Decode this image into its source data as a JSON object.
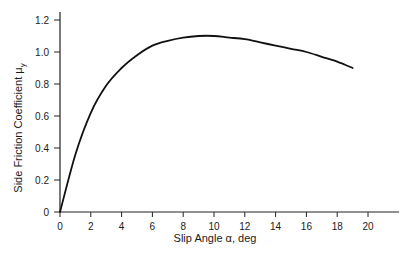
{
  "chart_data": {
    "type": "line",
    "title": "",
    "xlabel": "Slip Angle α, deg",
    "ylabel": "Side Friction Coefficient μ",
    "ylabel_subscript": "y",
    "xlim": [
      0,
      22
    ],
    "ylim": [
      0,
      1.2
    ],
    "xticks": [
      0,
      2,
      4,
      6,
      8,
      10,
      12,
      14,
      16,
      18,
      20
    ],
    "yticks": [
      0,
      0.2,
      0.4,
      0.6,
      0.8,
      1.0,
      1.2
    ],
    "xtick_labels": [
      "0",
      "2",
      "4",
      "6",
      "8",
      "10",
      "12",
      "14",
      "16",
      "18",
      "20"
    ],
    "ytick_labels": [
      "0",
      "0.2",
      "0.4",
      "0.6",
      "0.8",
      "1.0",
      "1.2"
    ],
    "grid": false,
    "legend": null,
    "series": [
      {
        "name": "Side friction coefficient",
        "x": [
          0,
          1,
          2,
          3,
          4,
          5,
          6,
          7,
          8,
          9,
          10,
          11,
          12,
          13,
          14,
          15,
          16,
          17,
          18,
          19
        ],
        "values": [
          0,
          0.36,
          0.62,
          0.79,
          0.9,
          0.98,
          1.04,
          1.07,
          1.09,
          1.1,
          1.1,
          1.09,
          1.08,
          1.06,
          1.04,
          1.02,
          1.0,
          0.97,
          0.94,
          0.9
        ]
      }
    ]
  },
  "colors": {
    "line": "#111111",
    "axis": "#222222",
    "background": "#ffffff"
  }
}
